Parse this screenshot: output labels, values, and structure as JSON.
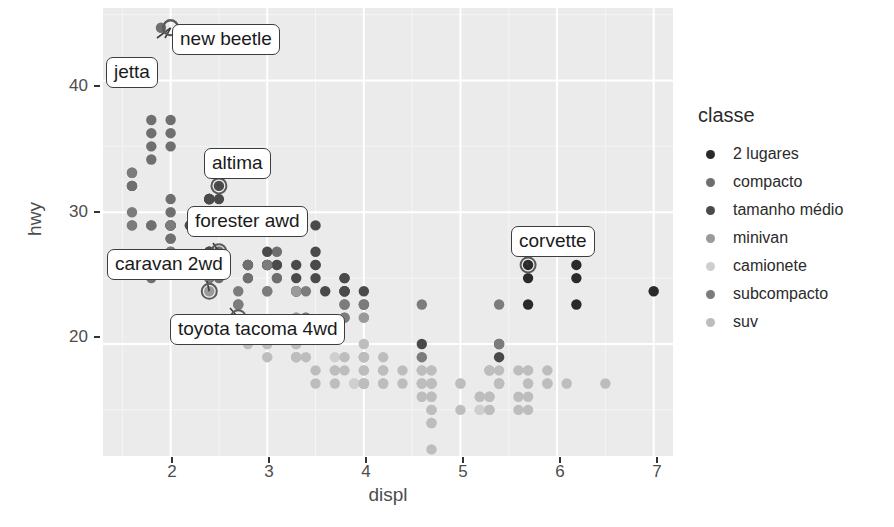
{
  "chart_data": {
    "type": "scatter",
    "title": "",
    "xlabel": "displ",
    "ylabel": "hwy",
    "xlim": [
      1.3,
      7.2
    ],
    "ylim": [
      11.5,
      45.5
    ],
    "xticks": [
      "2",
      "3",
      "4",
      "5",
      "6",
      "7"
    ],
    "xtick_values": [
      2,
      3,
      4,
      5,
      6,
      7
    ],
    "yticks": [
      "20",
      "30",
      "40"
    ],
    "ytick_values": [
      20,
      30,
      40
    ],
    "grid": true,
    "grid_color": "#ffffff",
    "panel_background": "#ebebeb",
    "legend": {
      "title": "classe",
      "position": "right",
      "entries": [
        {
          "label": "2 lugares",
          "color": "#2a2a2a"
        },
        {
          "label": "compacto",
          "color": "#6f6f6f"
        },
        {
          "label": "tamanho médio",
          "color": "#4a4a4a"
        },
        {
          "label": "minivan",
          "color": "#9a9a9a"
        },
        {
          "label": "camionete",
          "color": "#cfcfcf"
        },
        {
          "label": "subcompacto",
          "color": "#7c7c7c"
        },
        {
          "label": "suv",
          "color": "#bdbdbd"
        }
      ]
    },
    "annotations": [
      {
        "label": "jetta",
        "point": [
          2.0,
          44.0
        ],
        "box": [
          106,
          57
        ],
        "anchor": [
          157,
          38
        ]
      },
      {
        "label": "new beetle",
        "point": [
          2.0,
          44.0
        ],
        "box": [
          172,
          24
        ],
        "anchor": [
          165,
          38
        ]
      },
      {
        "label": "altima",
        "point": [
          2.5,
          32.0
        ],
        "box": [
          204,
          148
        ],
        "anchor": [
          218,
          184
        ]
      },
      {
        "label": "forester awd",
        "point": [
          2.5,
          27.0
        ],
        "box": [
          187,
          206
        ],
        "anchor": [
          213,
          243
        ]
      },
      {
        "label": "caravan 2wd",
        "point": [
          2.4,
          24.0
        ],
        "box": [
          107,
          249
        ],
        "anchor": [
          207,
          281
        ]
      },
      {
        "label": "toyota tacoma 4wd",
        "point": [
          2.7,
          22.0
        ],
        "box": [
          170,
          314
        ],
        "anchor": [
          230,
          308
        ]
      },
      {
        "label": "corvette",
        "point": [
          5.7,
          26.0
        ],
        "box": [
          511,
          226
        ],
        "anchor": [
          527,
          262
        ]
      }
    ],
    "series": [
      {
        "name": "2 lugares",
        "color": "#2a2a2a",
        "points": [
          [
            5.7,
            26
          ],
          [
            5.7,
            25
          ],
          [
            6.2,
            26
          ],
          [
            6.2,
            25
          ],
          [
            7.0,
            24
          ],
          [
            5.7,
            23
          ],
          [
            6.2,
            23
          ]
        ]
      },
      {
        "name": "compacto",
        "color": "#6f6f6f",
        "points": [
          [
            1.8,
            29
          ],
          [
            1.8,
            29
          ],
          [
            2.0,
            31
          ],
          [
            2.0,
            30
          ],
          [
            2.8,
            26
          ],
          [
            2.8,
            26
          ],
          [
            3.1,
            27
          ],
          [
            1.8,
            26
          ],
          [
            1.8,
            25
          ],
          [
            2.0,
            28
          ],
          [
            2.0,
            27
          ],
          [
            2.8,
            25
          ],
          [
            2.8,
            25
          ],
          [
            3.1,
            25
          ],
          [
            3.1,
            25
          ],
          [
            2.4,
            27
          ],
          [
            2.4,
            25
          ],
          [
            2.5,
            27
          ],
          [
            2.5,
            25
          ],
          [
            3.3,
            24
          ],
          [
            2.0,
            29
          ],
          [
            2.0,
            29
          ],
          [
            2.0,
            28
          ],
          [
            2.0,
            29
          ],
          [
            1.6,
            33
          ],
          [
            1.6,
            32
          ],
          [
            1.6,
            32
          ],
          [
            1.6,
            29
          ],
          [
            1.6,
            32
          ],
          [
            1.8,
            34
          ],
          [
            1.8,
            36
          ],
          [
            2.0,
            36
          ],
          [
            2.4,
            29
          ],
          [
            2.4,
            27
          ],
          [
            2.4,
            31
          ],
          [
            2.4,
            31
          ],
          [
            2.5,
            26
          ],
          [
            2.5,
            27
          ],
          [
            1.8,
            37
          ],
          [
            1.8,
            35
          ],
          [
            2.0,
            37
          ],
          [
            2.0,
            35
          ],
          [
            2.8,
            26
          ],
          [
            2.8,
            26
          ],
          [
            3.1,
            26
          ],
          [
            1.9,
            44
          ],
          [
            2.0,
            29
          ],
          [
            2.0,
            29
          ],
          [
            2.5,
            29
          ],
          [
            2.5,
            29
          ]
        ]
      },
      {
        "name": "tamanho médio",
        "color": "#4a4a4a",
        "points": [
          [
            2.4,
            31
          ],
          [
            3.0,
            27
          ],
          [
            3.5,
            26
          ],
          [
            2.4,
            31
          ],
          [
            3.0,
            26
          ],
          [
            3.5,
            27
          ],
          [
            3.3,
            24
          ],
          [
            3.8,
            24
          ],
          [
            3.3,
            25
          ],
          [
            3.8,
            24
          ],
          [
            2.5,
            32
          ],
          [
            2.5,
            29
          ],
          [
            2.5,
            31
          ],
          [
            3.5,
            29
          ],
          [
            2.2,
            29
          ],
          [
            2.2,
            29
          ],
          [
            2.4,
            31
          ],
          [
            2.4,
            30
          ],
          [
            3.0,
            26
          ],
          [
            3.0,
            26
          ],
          [
            3.5,
            26
          ],
          [
            3.3,
            24
          ],
          [
            2.4,
            29
          ],
          [
            2.4,
            27
          ],
          [
            3.1,
            26
          ],
          [
            3.8,
            25
          ],
          [
            4.0,
            24
          ],
          [
            2.5,
            26
          ],
          [
            2.5,
            26
          ],
          [
            3.3,
            26
          ],
          [
            3.5,
            25
          ],
          [
            3.6,
            24
          ],
          [
            3.8,
            25
          ],
          [
            3.8,
            24
          ],
          [
            4.0,
            23
          ],
          [
            4.6,
            20
          ],
          [
            5.4,
            20
          ],
          [
            5.4,
            19
          ]
        ]
      },
      {
        "name": "minivan",
        "color": "#9a9a9a",
        "points": [
          [
            2.4,
            24
          ],
          [
            3.0,
            24
          ],
          [
            3.3,
            22
          ],
          [
            3.3,
            24
          ],
          [
            3.3,
            24
          ],
          [
            3.3,
            22
          ],
          [
            3.3,
            21
          ],
          [
            3.8,
            23
          ],
          [
            3.8,
            23
          ],
          [
            4.0,
            22
          ],
          [
            4.0,
            22
          ]
        ]
      },
      {
        "name": "camionete",
        "color": "#cfcfcf",
        "points": [
          [
            3.7,
            18
          ],
          [
            3.7,
            19
          ],
          [
            4.0,
            17
          ],
          [
            4.0,
            19
          ],
          [
            4.7,
            16
          ],
          [
            4.7,
            17
          ],
          [
            4.7,
            17
          ],
          [
            5.2,
            15
          ],
          [
            5.2,
            15
          ],
          [
            3.9,
            17
          ],
          [
            3.9,
            17
          ],
          [
            4.7,
            16
          ],
          [
            4.7,
            15
          ],
          [
            4.7,
            15
          ],
          [
            5.2,
            15
          ],
          [
            5.7,
            17
          ],
          [
            5.9,
            17
          ],
          [
            4.7,
            18
          ],
          [
            4.7,
            17
          ],
          [
            4.7,
            17
          ],
          [
            5.2,
            16
          ],
          [
            5.2,
            16
          ],
          [
            5.7,
            18
          ],
          [
            5.9,
            17
          ],
          [
            4.6,
            19
          ],
          [
            5.4,
            17
          ],
          [
            5.4,
            17
          ],
          [
            4.0,
            17
          ],
          [
            4.0,
            17
          ],
          [
            4.6,
            16
          ],
          [
            5.0,
            17
          ],
          [
            4.2,
            17
          ],
          [
            4.2,
            17
          ]
        ]
      },
      {
        "name": "subcompacto",
        "color": "#7c7c7c",
        "points": [
          [
            2.2,
            26
          ],
          [
            2.2,
            26
          ],
          [
            2.5,
            26
          ],
          [
            2.5,
            26
          ],
          [
            2.7,
            24
          ],
          [
            2.7,
            23
          ],
          [
            3.4,
            24
          ],
          [
            3.4,
            22
          ],
          [
            1.6,
            33
          ],
          [
            1.6,
            30
          ],
          [
            1.6,
            29
          ],
          [
            1.8,
            26
          ],
          [
            1.8,
            26
          ],
          [
            2.0,
            29
          ],
          [
            2.0,
            27
          ],
          [
            2.4,
            25
          ],
          [
            2.4,
            25
          ],
          [
            2.5,
            26
          ],
          [
            3.0,
            26
          ],
          [
            3.8,
            23
          ],
          [
            3.8,
            22
          ],
          [
            4.0,
            23
          ],
          [
            4.6,
            23
          ],
          [
            5.4,
            23
          ],
          [
            2.7,
            23
          ],
          [
            3.0,
            24
          ],
          [
            3.4,
            22
          ],
          [
            3.4,
            21
          ],
          [
            3.8,
            22
          ],
          [
            4.6,
            19
          ],
          [
            5.4,
            20
          ]
        ]
      },
      {
        "name": "suv",
        "color": "#bdbdbd",
        "points": [
          [
            4.0,
            17
          ],
          [
            4.0,
            17
          ],
          [
            4.6,
            17
          ],
          [
            5.0,
            15
          ],
          [
            4.2,
            17
          ],
          [
            4.4,
            17
          ],
          [
            4.6,
            16
          ],
          [
            5.4,
            17
          ],
          [
            5.4,
            17
          ],
          [
            4.0,
            19
          ],
          [
            4.0,
            18
          ],
          [
            4.6,
            17
          ],
          [
            5.0,
            17
          ],
          [
            3.0,
            20
          ],
          [
            3.3,
            20
          ],
          [
            3.3,
            19
          ],
          [
            3.7,
            18
          ],
          [
            3.7,
            17
          ],
          [
            4.0,
            17
          ],
          [
            4.7,
            17
          ],
          [
            4.7,
            17
          ],
          [
            4.7,
            18
          ],
          [
            5.2,
            16
          ],
          [
            5.7,
            17
          ],
          [
            5.9,
            17
          ],
          [
            4.6,
            18
          ],
          [
            5.4,
            18
          ],
          [
            6.5,
            17
          ],
          [
            3.3,
            20
          ],
          [
            3.3,
            19
          ],
          [
            3.8,
            19
          ],
          [
            3.8,
            18
          ],
          [
            4.0,
            20
          ],
          [
            4.0,
            19
          ],
          [
            4.7,
            16
          ],
          [
            4.7,
            15
          ],
          [
            5.7,
            15
          ],
          [
            5.7,
            16
          ],
          [
            6.1,
            17
          ],
          [
            2.8,
            20
          ],
          [
            3.3,
            19
          ],
          [
            3.4,
            19
          ],
          [
            4.0,
            19
          ],
          [
            4.0,
            18
          ],
          [
            4.2,
            18
          ],
          [
            4.4,
            18
          ],
          [
            4.6,
            18
          ],
          [
            5.3,
            18
          ],
          [
            5.3,
            18
          ],
          [
            5.3,
            18
          ],
          [
            5.6,
            18
          ],
          [
            5.7,
            18
          ],
          [
            5.9,
            18
          ],
          [
            4.7,
            12
          ],
          [
            3.0,
            19
          ],
          [
            3.0,
            20
          ],
          [
            3.5,
            18
          ],
          [
            3.5,
            17
          ],
          [
            4.7,
            14
          ],
          [
            4.7,
            14
          ],
          [
            5.3,
            16
          ],
          [
            5.3,
            16
          ],
          [
            5.3,
            15
          ],
          [
            5.3,
            15
          ],
          [
            5.6,
            15
          ],
          [
            5.6,
            16
          ],
          [
            4.2,
            18
          ],
          [
            4.2,
            19
          ]
        ]
      }
    ]
  }
}
